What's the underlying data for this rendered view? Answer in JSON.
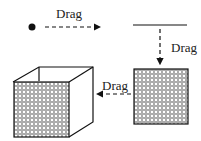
{
  "diagram": {
    "labels": {
      "drag1": "Drag",
      "drag2": "Drag",
      "drag3": "Drag"
    },
    "colors": {
      "ink": "#111111",
      "fill_pattern": "#444444"
    },
    "steps": [
      {
        "from": "point",
        "to": "line",
        "action": "Drag",
        "direction": "right"
      },
      {
        "from": "line",
        "to": "square",
        "action": "Drag",
        "direction": "down"
      },
      {
        "from": "square",
        "to": "cube",
        "action": "Drag",
        "direction": "left"
      }
    ]
  }
}
